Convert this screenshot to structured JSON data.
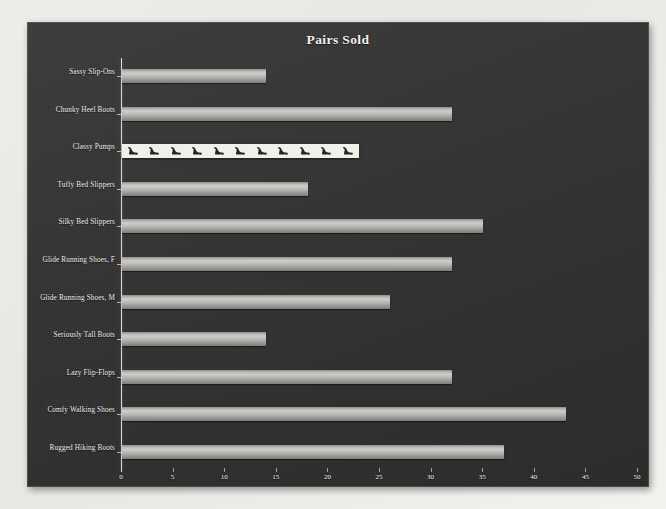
{
  "chart_data": {
    "type": "bar",
    "orientation": "horizontal",
    "title": "Pairs Sold",
    "xlabel": "",
    "ylabel": "",
    "xlim": [
      0,
      50
    ],
    "xticks": [
      0,
      5,
      10,
      15,
      20,
      25,
      30,
      35,
      40,
      45,
      50
    ],
    "grid": false,
    "legend": false,
    "categories": [
      "Sassy Slip-Ons",
      "Chunky Heel Boots",
      "Classy Pumps",
      "Tuffy Bed Slippers",
      "Silky Bed Slippers",
      "Glide Running Shoes, F",
      "Glide Running Shoes, M",
      "Seriously Tall Boots",
      "Lazy Flip-Flops",
      "Comfy Walking Shoes",
      "Rugged Hiking Boots"
    ],
    "values": [
      14,
      32,
      23,
      18,
      35,
      32,
      26,
      14,
      32,
      43,
      37
    ],
    "bar_fills": [
      "gradient-gray",
      "gradient-gray",
      "picture-high-heel",
      "gradient-gray",
      "gradient-gray",
      "gradient-gray",
      "gradient-gray",
      "gradient-gray",
      "gradient-gray",
      "gradient-gray",
      "gradient-gray"
    ],
    "colors": {
      "plot_background": "#333333",
      "bar_light": "#cfcdc9",
      "bar_dark": "#7f7d7a",
      "picture_fill_background": "#f1efe9",
      "picture_icon": "#2b2b2b",
      "axis": "#d8d6d2",
      "text": "#efeeec"
    }
  }
}
